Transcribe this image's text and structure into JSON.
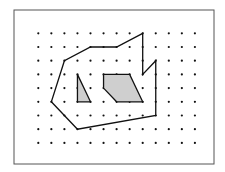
{
  "figure": {
    "frame": {
      "x": 14,
      "y": 10,
      "width": 200,
      "height": 154,
      "stroke": "#555555"
    },
    "grid": {
      "columns": 13,
      "rows": 9,
      "origin_x": 38.3,
      "origin_y": 33.3,
      "step_x": 13.05,
      "step_y": 13.7,
      "dot_radius": 1.1,
      "dot_color": "#111111"
    },
    "shapes": [
      {
        "name": "outer-polygon",
        "fill": "none",
        "stroke": "#111111",
        "points": [
          [
            8,
            0
          ],
          [
            8,
            3
          ],
          [
            9,
            2
          ],
          [
            9,
            6
          ],
          [
            3,
            7
          ],
          [
            1,
            5
          ],
          [
            2,
            2
          ],
          [
            4,
            1
          ],
          [
            6,
            1
          ]
        ]
      },
      {
        "name": "shaded-triangle",
        "fill": "#cfcfcf",
        "stroke": "#111111",
        "points": [
          [
            3,
            3
          ],
          [
            3,
            5
          ],
          [
            4,
            5
          ]
        ]
      },
      {
        "name": "shaded-pentagon",
        "fill": "#cfcfcf",
        "stroke": "#111111",
        "points": [
          [
            5,
            3
          ],
          [
            7,
            3
          ],
          [
            8,
            5
          ],
          [
            6,
            5
          ],
          [
            5,
            4
          ]
        ]
      }
    ]
  }
}
